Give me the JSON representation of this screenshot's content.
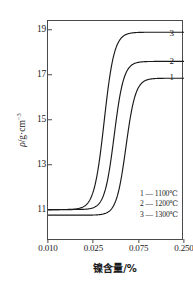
{
  "chart_data": {
    "type": "line",
    "title": "",
    "xlabel": "镍含量/%",
    "ylabel": "ρ/g·cm⁻³",
    "x_tick_labels": [
      "0.010",
      "0.025",
      "0.075",
      "0.250"
    ],
    "x_tick_positions": [
      0,
      1,
      2,
      3
    ],
    "y_tick_labels": [
      "11",
      "13",
      "15",
      "17",
      "19"
    ],
    "y_tick_values": [
      11,
      13,
      15,
      17,
      19
    ],
    "ylim": [
      9.6,
      19.4
    ],
    "xlim": [
      0,
      3.0
    ],
    "grid": false,
    "legend_position": "bottom-right",
    "axis_scale_note": "x axis uses non-uniform (log-like) spacing with evenly spaced tick marks",
    "series": [
      {
        "name": "1",
        "legend_label": "1 — 1100℃",
        "temperature": "1100℃",
        "end_label": "1",
        "baseline_value": 10.75,
        "plateau_value": 16.85,
        "midpoint_x": 1.72,
        "steepness": 9.5
      },
      {
        "name": "2",
        "legend_label": "2 — 1200℃",
        "temperature": "1200℃",
        "end_label": "2",
        "baseline_value": 11.0,
        "plateau_value": 17.6,
        "midpoint_x": 1.46,
        "steepness": 9.5
      },
      {
        "name": "3",
        "legend_label": "3 — 1300℃",
        "temperature": "1300℃",
        "end_label": "3",
        "baseline_value": 11.0,
        "plateau_value": 18.9,
        "midpoint_x": 1.24,
        "steepness": 9.0
      }
    ]
  },
  "axes": {
    "y_title_prefix": "ρ",
    "y_title_mid": "/g·cm",
    "y_title_sup": "−3",
    "x_title": "镍含量/%"
  },
  "legend": {
    "rows": [
      {
        "label": "1 — 1100℃"
      },
      {
        "label": "2 — 1200℃"
      },
      {
        "label": "3 — 1300℃"
      }
    ]
  },
  "curve_labels": [
    {
      "text": "3"
    },
    {
      "text": "2"
    },
    {
      "text": "1"
    }
  ],
  "colors": {
    "background": "#ffffff",
    "axis": "#4a4a4a",
    "curve": "#1a1a1a",
    "text": "#1a1a1a"
  }
}
